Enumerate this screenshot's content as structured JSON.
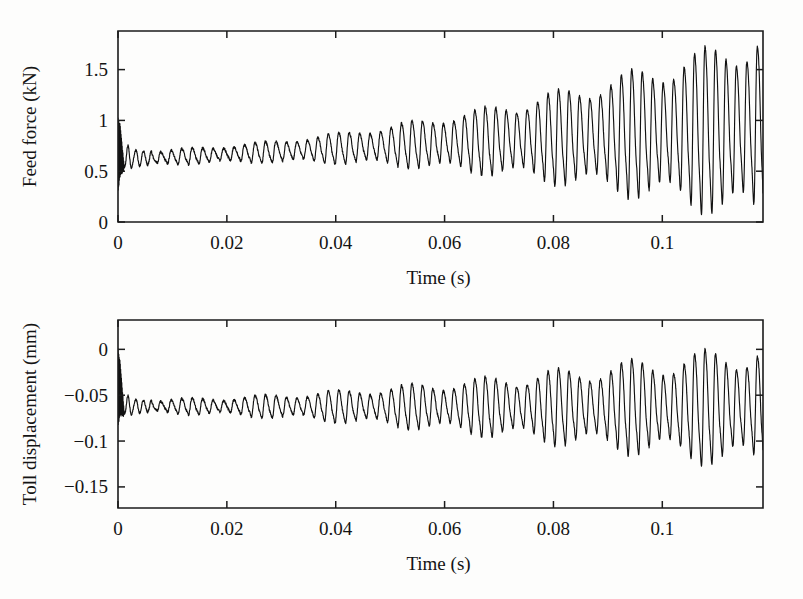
{
  "page": {
    "background": "#fdfdfc",
    "ink": "#141414",
    "width": 803,
    "height": 599
  },
  "chart_data": [
    {
      "id": "feed-force",
      "type": "line",
      "title": "",
      "xlabel": "Time (s)",
      "ylabel": "Feed force (kN)",
      "xlim": [
        0,
        0.1185
      ],
      "ylim": [
        0,
        1.88
      ],
      "xticks": [
        0,
        0.02,
        0.04,
        0.06,
        0.08,
        0.1
      ],
      "xticklabels": [
        "0",
        "0.02",
        "0.04",
        "0.06",
        "0.08",
        "0.1"
      ],
      "yticks": [
        0,
        0.5,
        1,
        1.5
      ],
      "yticklabels": [
        "0",
        "0.5",
        "1",
        "1.5"
      ],
      "grid": false,
      "legend": "none",
      "series": [
        {
          "name": "Feed force",
          "description": "Self-excited chatter vibration of feed force growing from ~0.6 kN mean to full clipping at 0 kN after t=0.057 s",
          "model": {
            "kind": "modulated-oscillation",
            "carrier_hz": 520,
            "beat_hz": 74,
            "beat_depth": 0.34,
            "mean_start": 0.63,
            "mean_end": 0.95,
            "amp_start": 0.085,
            "amp_end": 1.12,
            "amp_growth_power": 2.05,
            "clip_min": 0.0,
            "clip_max": 1.86,
            "transient_end_t": 0.0062,
            "transient_carrier_hz": 690,
            "transient_amp": 0.17,
            "onset_spike_t": 0.0012,
            "onset_spike_high": 1.02,
            "onset_spike_low": 0.3,
            "noise": 0.012,
            "samples": 3400
          }
        }
      ]
    },
    {
      "id": "toll-displacement",
      "type": "line",
      "title": "",
      "xlabel": "Time (s)",
      "ylabel": "Toll displacement (mm)",
      "xlim": [
        0,
        0.1185
      ],
      "ylim": [
        -0.173,
        0.032
      ],
      "xticks": [
        0,
        0.02,
        0.04,
        0.06,
        0.08,
        0.1
      ],
      "xticklabels": [
        "0",
        "0.02",
        "0.04",
        "0.06",
        "0.08",
        "0.1"
      ],
      "yticks": [
        0,
        -0.05,
        -0.1,
        -0.15
      ],
      "yticklabels": [
        "0",
        "−0.05",
        "−0.1",
        "−0.15"
      ],
      "grid": false,
      "legend": "none",
      "series": [
        {
          "name": "Toll displacement",
          "description": "Tool displacement oscillation about -0.065 mm, amplitude growing from ~0.008 mm to ~0.08 mm with strong beating",
          "model": {
            "kind": "modulated-oscillation",
            "carrier_hz": 520,
            "beat_hz": 74,
            "beat_depth": 0.42,
            "mean_start": -0.062,
            "mean_end": -0.062,
            "amp_start": 0.009,
            "amp_end": 0.082,
            "amp_growth_power": 1.55,
            "clip_min": -0.163,
            "clip_max": 0.021,
            "transient_end_t": 0.0062,
            "transient_carrier_hz": 690,
            "transient_amp": 0.016,
            "onset_spike_t": 0.0012,
            "onset_spike_high": 0.0,
            "onset_spike_low": -0.083,
            "noise": 0.0013,
            "samples": 3400
          }
        }
      ]
    }
  ],
  "layout": {
    "plot_left": 118,
    "plot_right": 763,
    "top_plot_top": 31,
    "top_plot_bottom": 222,
    "bottom_plot_top": 320,
    "bottom_plot_bottom": 508,
    "tick_len": 7,
    "xlabel_offset": 62,
    "ticklabel_offset": 27
  }
}
